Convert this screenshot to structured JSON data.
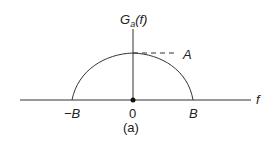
{
  "figure": {
    "y_axis_label": "G",
    "y_axis_subscript": "a",
    "y_axis_arg": "(f)",
    "x_axis_label": "f",
    "peak_label": "A",
    "tick_labels": [
      "−B",
      "0",
      "B"
    ],
    "caption": "(a)"
  },
  "colors": {
    "line": "#333333",
    "background": "#ffffff"
  }
}
